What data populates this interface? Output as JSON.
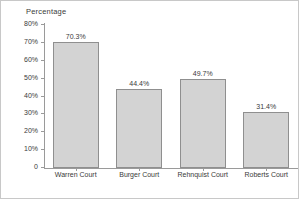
{
  "chart_data": {
    "type": "bar",
    "title": "",
    "ylabel": "Percentage",
    "xlabel": "",
    "categories": [
      "Warren Court",
      "Burger Court",
      "Rehnquist Court",
      "Roberts Court"
    ],
    "values": [
      70.3,
      44.4,
      49.7,
      31.4
    ],
    "value_labels": [
      "70.3%",
      "44.4%",
      "49.7%",
      "31.4%"
    ],
    "ylim": [
      0,
      80
    ],
    "ytick_values": [
      80,
      70,
      60,
      50,
      40,
      30,
      20,
      10,
      0
    ],
    "ytick_labels": [
      "80%",
      "70%",
      "60%",
      "50%",
      "40%",
      "30%",
      "20%",
      "10%",
      "0"
    ],
    "grid": false,
    "legend": false,
    "colors": {
      "bar_fill": "#d3d3d3",
      "bar_border": "#8f8f8f",
      "axis": "#9a9a9a",
      "text": "#3a3a3a",
      "background": "#ffffff",
      "frame": "#c8c8c8"
    }
  }
}
